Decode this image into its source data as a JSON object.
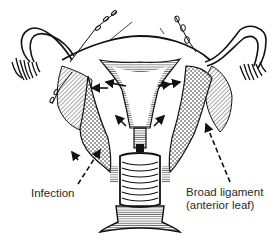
{
  "figure": {
    "colors": {
      "ink": "#111111",
      "background": "#ffffff",
      "label": "#2a2a2a"
    }
  },
  "labels": {
    "infection": "Infection",
    "broad_ligament_line1": "Broad ligament",
    "broad_ligament_line2": "(anterior leaf)"
  },
  "annotations": [
    {
      "label": "Infection",
      "pointer": "dashed-arrow",
      "target": "left parametrium"
    },
    {
      "label": "Broad ligament (anterior leaf)",
      "pointer": "dashed-arrow",
      "target": "right broad ligament"
    }
  ]
}
